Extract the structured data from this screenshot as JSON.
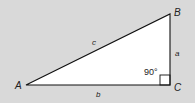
{
  "diagram": {
    "colors": {
      "background": "#d9d9d9",
      "fill": "#ffffff",
      "stroke": "#111111"
    },
    "vertices": {
      "A": {
        "label": "A",
        "x": 26,
        "y": 85
      },
      "B": {
        "label": "B",
        "x": 170,
        "y": 14
      },
      "C": {
        "label": "C",
        "x": 170,
        "y": 85
      }
    },
    "sides": {
      "a": {
        "label": "a",
        "between": "B-C"
      },
      "b": {
        "label": "b",
        "between": "A-C"
      },
      "c": {
        "label": "c",
        "between": "A-B"
      }
    },
    "angle": {
      "vertex": "C",
      "label": "90°"
    }
  }
}
